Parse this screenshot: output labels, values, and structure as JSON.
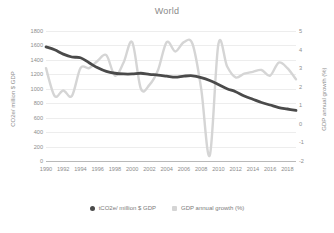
{
  "chart_data": {
    "type": "line",
    "title": "World",
    "xlabel": "",
    "ylabel": "CO2e/ million $ GDP",
    "y2label": "GDP annual growth (%)",
    "grid": true,
    "legend_position": "bottom",
    "ylim": [
      0,
      1800
    ],
    "y2lim": [
      -2,
      5
    ],
    "xlim": [
      1990,
      2019
    ],
    "yticks": [
      "1800",
      "1600",
      "1400",
      "1200",
      "1000",
      "800",
      "600",
      "400",
      "200",
      "0"
    ],
    "ytick_values": [
      1800,
      1600,
      1400,
      1200,
      1000,
      800,
      600,
      400,
      200,
      0
    ],
    "y2ticks": [
      "5",
      "4",
      "3",
      "2",
      "1",
      "0",
      "-1",
      "-2"
    ],
    "y2tick_values": [
      5,
      4,
      3,
      2,
      1,
      0,
      -1,
      -2
    ],
    "xticks": [
      "1990",
      "1992",
      "1994",
      "1996",
      "1998",
      "2000",
      "2002",
      "2004",
      "2006",
      "2008",
      "2010",
      "2012",
      "2014",
      "2016",
      "2018"
    ],
    "x": [
      1990,
      1991,
      1992,
      1993,
      1994,
      1995,
      1996,
      1997,
      1998,
      1999,
      2000,
      2001,
      2002,
      2003,
      2004,
      2005,
      2006,
      2007,
      2008,
      2009,
      2010,
      2011,
      2012,
      2013,
      2014,
      2015,
      2016,
      2017,
      2018,
      2019
    ],
    "series": [
      {
        "name": "tCO2e/ million $ GDP",
        "axis": "left",
        "color": "#4a4a4a",
        "values": [
          1580,
          1540,
          1480,
          1440,
          1430,
          1360,
          1290,
          1240,
          1215,
          1205,
          1205,
          1215,
          1200,
          1190,
          1175,
          1160,
          1175,
          1180,
          1155,
          1115,
          1060,
          1000,
          960,
          900,
          855,
          810,
          775,
          740,
          720,
          700
        ]
      },
      {
        "name": "GDP annual growth (%)",
        "axis": "right",
        "color": "#d5d5d5",
        "values": [
          3.0,
          1.5,
          1.8,
          1.5,
          3.0,
          3.0,
          3.4,
          3.7,
          2.6,
          3.3,
          4.4,
          1.9,
          2.1,
          2.9,
          4.4,
          3.9,
          4.4,
          4.3,
          1.9,
          -1.7,
          4.3,
          3.1,
          2.5,
          2.7,
          2.8,
          2.9,
          2.6,
          3.3,
          3.0,
          2.4
        ]
      }
    ]
  },
  "legend": {
    "items": [
      {
        "label": "tCO2e/ million $ GDP",
        "color": "#4a4a4a",
        "marker": "circle"
      },
      {
        "label": "GDP annual growth (%)",
        "color": "#d5d5d5",
        "marker": "square"
      }
    ]
  }
}
